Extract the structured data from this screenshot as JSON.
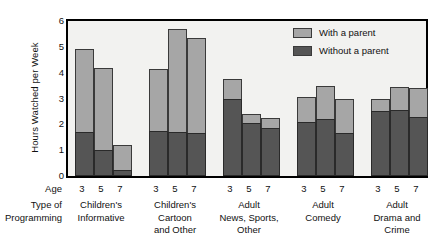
{
  "chart_data": {
    "type": "bar",
    "subtype": "stacked-grouped",
    "title": "",
    "xlabel": "Type of Programming",
    "ylabel": "Hours Watched per Week",
    "ylim": [
      0,
      6
    ],
    "yticks": [
      0,
      1,
      2,
      3,
      4,
      5,
      6
    ],
    "grid": false,
    "legend_position": "top-right",
    "x_row_labels": {
      "age": "Age",
      "type": "Type of\nProgramming"
    },
    "age_categories": [
      "3",
      "5",
      "7"
    ],
    "categories": [
      "Children's Informative",
      "Children's Cartoon and Other",
      "Adult News, Sports, Other",
      "Adult Comedy",
      "Adult Drama and Crime"
    ],
    "category_lines": [
      [
        "Children's",
        "Informative"
      ],
      [
        "Children's",
        "Cartoon",
        "and Other"
      ],
      [
        "Adult",
        "News, Sports,",
        "Other"
      ],
      [
        "Adult",
        "Comedy"
      ],
      [
        "Adult",
        "Drama and",
        "Crime"
      ]
    ],
    "series": [
      {
        "name": "Without a parent",
        "color": "#555555",
        "values": [
          [
            1.7,
            1.0,
            0.25
          ],
          [
            1.75,
            1.7,
            1.65
          ],
          [
            3.0,
            2.05,
            1.85
          ],
          [
            2.1,
            2.2,
            1.65
          ],
          [
            2.5,
            2.55,
            2.3
          ]
        ]
      },
      {
        "name": "With a parent",
        "color": "#a6a6a6",
        "values": [
          [
            3.2,
            3.2,
            0.95
          ],
          [
            2.4,
            4.0,
            3.7
          ],
          [
            0.75,
            0.35,
            0.4
          ],
          [
            0.95,
            1.3,
            1.35
          ],
          [
            0.5,
            0.9,
            1.1
          ]
        ]
      }
    ],
    "totals": [
      [
        4.9,
        4.2,
        1.2
      ],
      [
        4.15,
        5.7,
        5.35
      ],
      [
        3.75,
        2.4,
        2.25
      ],
      [
        3.05,
        3.5,
        3.0
      ],
      [
        3.0,
        3.45,
        3.4
      ]
    ]
  },
  "legend": {
    "entries": [
      {
        "label": "With a parent",
        "color": "#a6a6a6"
      },
      {
        "label": "Without a parent",
        "color": "#555555"
      }
    ]
  }
}
